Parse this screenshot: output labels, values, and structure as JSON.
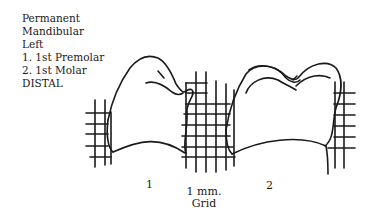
{
  "legend": {
    "lines": [
      "Permanent",
      "Mandibular",
      "Left",
      "1.  1st Premolar",
      "2.  1st Molar",
      "DISTAL"
    ]
  },
  "figure": {
    "tooth_labels": [
      "1",
      "2"
    ],
    "scale_label_line1": "1 mm.",
    "scale_label_line2": "Grid",
    "stroke_color": "#1a1a1a",
    "background": "#ffffff"
  }
}
